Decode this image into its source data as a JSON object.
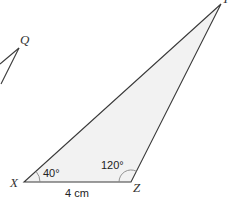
{
  "diagram": {
    "type": "geometry-triangle",
    "colors": {
      "stroke": "#3a3a3a",
      "fill": "#f2f2f2",
      "arc": "#888888",
      "background": "#ffffff"
    },
    "main_triangle": {
      "vertices": {
        "X": {
          "label": "X",
          "x": 24,
          "y": 182
        },
        "Z": {
          "label": "Z",
          "x": 131,
          "y": 182
        },
        "Y": {
          "label": "Y",
          "x": 221,
          "y": 4
        }
      },
      "angles": {
        "X": {
          "label": "40°",
          "degrees": 40
        },
        "Z": {
          "label": "120°",
          "degrees": 120
        }
      },
      "sides": {
        "XZ": {
          "label": "4 cm"
        }
      }
    },
    "partial_triangle": {
      "vertices": {
        "Q": {
          "label": "Q",
          "x": 19,
          "y": 48
        }
      }
    }
  }
}
